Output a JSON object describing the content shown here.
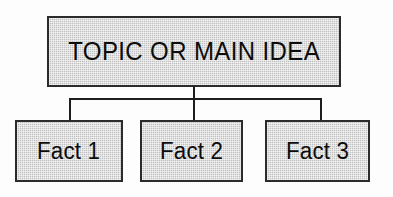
{
  "diagram": {
    "type": "hierarchy-tree",
    "title_text": "TOPIC OR MAIN IDEA",
    "background_color": "#fdfdfd",
    "node_fill_color": "#cbcbcb",
    "node_border_color": "#2b2b2b",
    "text_color": "#0c0c0c",
    "connector_color": "#1e1e1e",
    "root": {
      "label": "TOPIC OR MAIN IDEA"
    },
    "children": [
      {
        "label": "Fact 1"
      },
      {
        "label": "Fact 2"
      },
      {
        "label": "Fact 3"
      }
    ],
    "connectors": [
      {
        "name": "stem",
        "orientation": "vertical"
      },
      {
        "name": "bus",
        "orientation": "horizontal"
      },
      {
        "name": "drop-left",
        "orientation": "vertical"
      },
      {
        "name": "drop-center",
        "orientation": "vertical"
      },
      {
        "name": "drop-right",
        "orientation": "vertical"
      }
    ]
  }
}
